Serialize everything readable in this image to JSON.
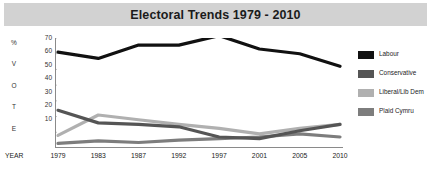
{
  "title": "Electoral Trends 1979 - 2010",
  "axis": {
    "y_letters": [
      "%",
      "V",
      "O",
      "T",
      "E"
    ],
    "y_ticks": [
      70,
      60,
      50,
      40,
      30,
      20,
      10
    ],
    "x_label": "YEAR"
  },
  "legend": {
    "items": [
      {
        "label": "Labour",
        "color": "#111111"
      },
      {
        "label": "Conservative",
        "color": "#555555"
      },
      {
        "label": "Liberal/Lib Dem",
        "color": "#b0b0b0"
      },
      {
        "label": "Plaid Cymru",
        "color": "#7d7d7d"
      }
    ]
  },
  "chart_data": {
    "type": "line",
    "title": "Electoral Trends 1979 - 2010",
    "xlabel": "YEAR",
    "ylabel": "% VOTE",
    "categories": [
      "1979",
      "1983",
      "1987",
      "1992",
      "1997",
      "2001",
      "2005",
      "2010"
    ],
    "ylim": [
      0,
      70
    ],
    "yticks": [
      10,
      20,
      30,
      40,
      50,
      60,
      70
    ],
    "grid": false,
    "legend_position": "right",
    "series": [
      {
        "name": "Labour",
        "color": "#111111",
        "values": [
          61,
          57,
          65.5,
          65.5,
          71.5,
          63,
          60,
          52
        ]
      },
      {
        "name": "Conservative",
        "color": "#555555",
        "values": [
          24,
          16,
          15,
          13.5,
          7,
          6,
          11,
          15
        ]
      },
      {
        "name": "Liberal/Lib Dem",
        "color": "#b0b0b0",
        "values": [
          8,
          21,
          18,
          15,
          12.5,
          9,
          12.5,
          15
        ]
      },
      {
        "name": "Plaid Cymru",
        "color": "#7d7d7d",
        "values": [
          3,
          4.5,
          3.5,
          5,
          6,
          7,
          9,
          7
        ]
      }
    ]
  }
}
